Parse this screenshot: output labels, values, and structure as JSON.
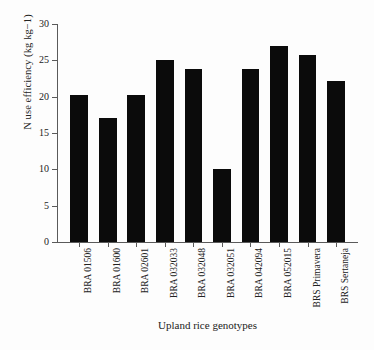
{
  "chart_data": {
    "type": "bar",
    "title": "",
    "xlabel": "Upland rice genotypes",
    "ylabel": "N use efficiency (kg kg−1)",
    "categories": [
      "BRA 01506",
      "BRA 01600",
      "BRA 02601",
      "BRA 032033",
      "BRA 032048",
      "BRA 032051",
      "BRA 042094",
      "BRA 052015",
      "BRS Primavera",
      "BRS Sertaneja"
    ],
    "values": [
      20.2,
      17.1,
      20.2,
      25.0,
      23.8,
      10.0,
      23.8,
      27.0,
      25.7,
      22.2
    ],
    "ylim": [
      0,
      30
    ],
    "ytick_labels": [
      "0",
      "5",
      "10",
      "15",
      "20",
      "25",
      "30"
    ],
    "ytick_values": [
      0,
      5,
      10,
      15,
      20,
      25,
      30
    ],
    "grid": false,
    "legend": false,
    "bar_color": "#0b0b0b",
    "axis_color": "#5a5a5a",
    "background": "#ffffff"
  },
  "axes": {
    "y_title": "N use efficiency (kg kg−1)",
    "x_title": "Upland rice genotypes"
  }
}
